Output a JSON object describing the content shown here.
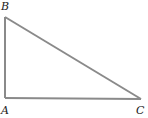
{
  "diagram": {
    "type": "right-triangle",
    "stroke_color": "#8a8a8a",
    "vertices": [
      {
        "name": "A",
        "label": "A",
        "x": 5,
        "y": 98,
        "right_angle": true
      },
      {
        "name": "B",
        "label": "B",
        "x": 5,
        "y": 17
      },
      {
        "name": "C",
        "label": "C",
        "x": 141,
        "y": 99
      }
    ],
    "edges": [
      {
        "from": "A",
        "to": "B"
      },
      {
        "from": "A",
        "to": "C"
      },
      {
        "from": "B",
        "to": "C"
      }
    ]
  }
}
